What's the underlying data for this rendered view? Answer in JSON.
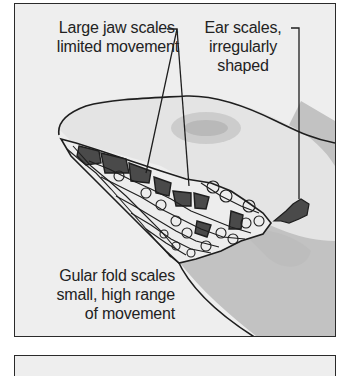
{
  "figure": {
    "labels": {
      "jaw": {
        "line1": "Large jaw scales,",
        "line2": "limited movement"
      },
      "ear": {
        "line1": "Ear scales,",
        "line2": "irregularly",
        "line3": "shaped"
      },
      "gular": {
        "line1": "Gular fold scales",
        "line2": "small, high range",
        "line3": "of movement"
      }
    },
    "colors": {
      "panel_bg": "#eeeeee",
      "outline": "#1e1e1e",
      "dark_scale": "#4a4a4a",
      "mid_scale": "#bdbdbd",
      "light_scale": "#f2f2f2",
      "throat_fill": "#bcbcbc",
      "head_shade": "#d6d6d6"
    }
  }
}
